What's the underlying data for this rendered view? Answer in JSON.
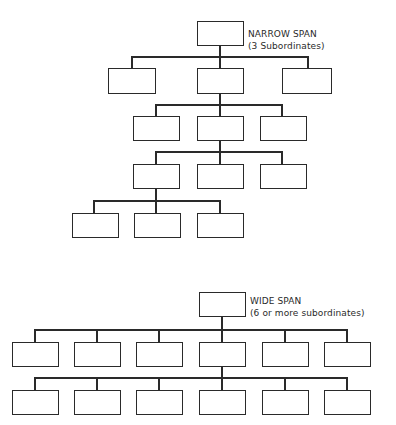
{
  "narrow_span": {
    "title": "NARROW SPAN",
    "subtitle": "(3 Subordinates)",
    "levels": 5,
    "subordinates_per_manager": 3
  },
  "wide_span": {
    "title": "WIDE SPAN",
    "subtitle": "(6 or more subordinates)",
    "levels": 3,
    "subordinates_per_manager": 6
  },
  "colors": {
    "line": "#2a2a2a",
    "background": "#ffffff"
  }
}
